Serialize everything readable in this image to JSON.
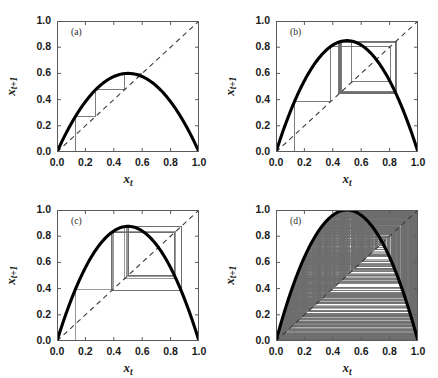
{
  "figure": {
    "width": 438,
    "height": 378,
    "background": "#ffffff",
    "caption_fragment": ""
  },
  "style": {
    "map_curve_color": "#000000",
    "diagonal_color": "#3a3a3a",
    "cobweb_color": "#6e6e6e",
    "axis_color": "#5a5a5a",
    "tick_label_color": "#1a1a1a"
  },
  "axis_labels": {
    "x": "x_t",
    "y": "x_{t+1}",
    "x_base": "x",
    "x_sub": "t",
    "y_base": "x",
    "y_sub": "t+1"
  },
  "ticks": {
    "x": [
      "0.0",
      "0.2",
      "0.4",
      "0.6",
      "0.8",
      "1.0"
    ],
    "y": [
      "0.0",
      "0.2",
      "0.4",
      "0.6",
      "0.8",
      "1.0"
    ],
    "x_values": [
      0.0,
      0.2,
      0.4,
      0.6,
      0.8,
      1.0
    ],
    "y_values": [
      0.0,
      0.2,
      0.4,
      0.6,
      0.8,
      1.0
    ]
  },
  "chart_data": [
    {
      "type": "line",
      "panel": "a",
      "label": "(a)",
      "title": "Logistic map cobweb, fixed point",
      "xlabel": "x_t",
      "ylabel": "x_{t+1}",
      "xlim": [
        0.0,
        1.0
      ],
      "ylim": [
        0.0,
        1.0
      ],
      "grid": false,
      "legend": "none",
      "r": 2.4,
      "x0": 0.13,
      "peak": 0.6,
      "n_iterations": 4,
      "series": [
        {
          "name": "map",
          "formula": "r*x*(1-x)",
          "r": 2.4
        },
        {
          "name": "diagonal",
          "formula": "y = x",
          "style": "dashed"
        },
        {
          "name": "cobweb",
          "x0": 0.13,
          "iterations": 4,
          "style": "solid-thin"
        }
      ]
    },
    {
      "type": "line",
      "panel": "b",
      "label": "(b)",
      "title": "Logistic map cobweb, period-2 cycle",
      "xlabel": "x_t",
      "ylabel": "x_{t+1}",
      "xlim": [
        0.0,
        1.0
      ],
      "ylim": [
        0.0,
        1.0
      ],
      "grid": false,
      "legend": "none",
      "r": 3.4,
      "x0": 0.13,
      "peak": 0.85,
      "n_iterations": 60,
      "series": [
        {
          "name": "map",
          "formula": "r*x*(1-x)",
          "r": 3.4
        },
        {
          "name": "diagonal",
          "formula": "y = x",
          "style": "dashed"
        },
        {
          "name": "cobweb",
          "x0": 0.13,
          "iterations": 60,
          "style": "solid-thin"
        }
      ]
    },
    {
      "type": "line",
      "panel": "c",
      "label": "(c)",
      "title": "Logistic map cobweb, period-4 cycle",
      "xlabel": "x_t",
      "ylabel": "x_{t+1}",
      "xlim": [
        0.0,
        1.0
      ],
      "ylim": [
        0.0,
        1.0
      ],
      "grid": false,
      "legend": "none",
      "r": 3.5,
      "x0": 0.13,
      "peak": 0.875,
      "n_iterations": 120,
      "series": [
        {
          "name": "map",
          "formula": "r*x*(1-x)",
          "r": 3.5
        },
        {
          "name": "diagonal",
          "formula": "y = x",
          "style": "dashed"
        },
        {
          "name": "cobweb",
          "x0": 0.13,
          "iterations": 120,
          "style": "solid-thin"
        }
      ]
    },
    {
      "type": "line",
      "panel": "d",
      "label": "(d)",
      "title": "Logistic map cobweb, chaotic regime",
      "xlabel": "x_t",
      "ylabel": "x_{t+1}",
      "xlim": [
        0.0,
        1.0
      ],
      "ylim": [
        0.0,
        1.0
      ],
      "grid": false,
      "legend": "none",
      "r": 4.0,
      "x0": 0.13,
      "peak": 1.0,
      "n_iterations": 900,
      "series": [
        {
          "name": "map",
          "formula": "r*x*(1-x)",
          "r": 4.0
        },
        {
          "name": "diagonal",
          "formula": "y = x",
          "style": "dashed"
        },
        {
          "name": "cobweb",
          "x0": 0.13,
          "iterations": 900,
          "style": "solid-thin"
        }
      ]
    }
  ],
  "panels": [
    {
      "id": "a",
      "label": "(a)",
      "left": 57,
      "top": 21,
      "width": 142,
      "height": 131
    },
    {
      "id": "b",
      "label": "(b)",
      "left": 276,
      "top": 21,
      "width": 142,
      "height": 131
    },
    {
      "id": "c",
      "label": "(c)",
      "left": 57,
      "top": 210,
      "width": 142,
      "height": 131
    },
    {
      "id": "d",
      "label": "(d)",
      "left": 276,
      "top": 210,
      "width": 142,
      "height": 131
    }
  ]
}
